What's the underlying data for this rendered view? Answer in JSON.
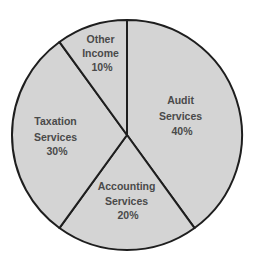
{
  "chart_data": {
    "type": "pie",
    "title": "",
    "categories": [
      "Audit Services",
      "Accounting Services",
      "Taxation Services",
      "Other Income"
    ],
    "values": [
      40,
      20,
      30,
      10
    ],
    "unit": "%",
    "start_angle_deg": 0,
    "direction": "clockwise",
    "slice_color": "#d4d4d4",
    "border_color": "#1e1e1e",
    "label_color": "#4a4a4a",
    "legend": "none",
    "slices": [
      {
        "name": "Audit Services",
        "value": 40,
        "label_lines": [
          "Audit",
          "Services",
          "40%"
        ]
      },
      {
        "name": "Accounting Services",
        "value": 20,
        "label_lines": [
          "Accounting",
          "Services",
          "20%"
        ]
      },
      {
        "name": "Taxation Services",
        "value": 30,
        "label_lines": [
          "Taxation",
          "Services",
          "30%"
        ]
      },
      {
        "name": "Other Income",
        "value": 10,
        "label_lines": [
          "Other",
          "Income",
          "10%"
        ]
      }
    ]
  }
}
